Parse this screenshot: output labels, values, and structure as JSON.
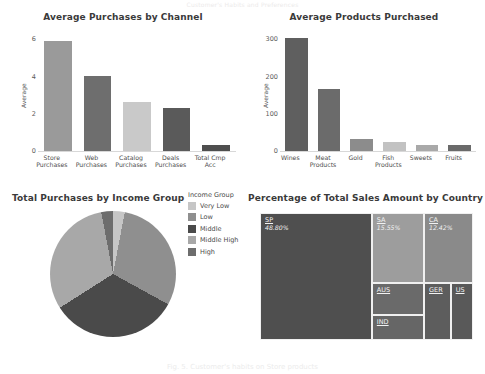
{
  "page": {
    "top_title": "Customer's Habits and Preferences",
    "caption": "Fig. 5.  Customer's habits on Store products"
  },
  "chart_data": [
    {
      "type": "bar",
      "title": "Average Purchases by Channel",
      "xlabel": "",
      "ylabel": "Average",
      "categories": [
        "Store Purchases",
        "Web Purchases",
        "Catalog Purchases",
        "Deals Purchases",
        "Total Cmp Acc"
      ],
      "values": [
        5.9,
        4.05,
        2.65,
        2.3,
        0.3
      ],
      "colors": [
        "#9a9a9a",
        "#6e6e6e",
        "#c9c9c9",
        "#5a5a5a",
        "#4e4e4e"
      ],
      "yticks": [
        0,
        2,
        4,
        6
      ],
      "ylim": [
        0,
        6.5
      ],
      "grid": false,
      "legend": "none"
    },
    {
      "type": "bar",
      "title": "Average Products Purchased",
      "xlabel": "",
      "ylabel": "Average",
      "categories": [
        "Wines",
        "Meat Products",
        "Gold",
        "Fish Products",
        "Sweets",
        "Fruits"
      ],
      "values": [
        303,
        167,
        33,
        25,
        15,
        17
      ],
      "colors": [
        "#5f5f5f",
        "#6b6b6b",
        "#8c8c8c",
        "#c2c2c2",
        "#a9a9a9",
        "#6a6a6a"
      ],
      "yticks": [
        0,
        100,
        200,
        300
      ],
      "ylim": [
        0,
        325
      ],
      "grid": false,
      "legend": "none"
    },
    {
      "type": "pie",
      "title": "Total Purchases by Income Group",
      "legend_title": "Income Group",
      "legend_position": "right",
      "slices": [
        {
          "label": "Very Low",
          "value": 3,
          "color": "#c6c6c6"
        },
        {
          "label": "Low",
          "value": 30,
          "color": "#8f8f8f"
        },
        {
          "label": "Middle",
          "value": 33,
          "color": "#4a4a4a"
        },
        {
          "label": "Middle High",
          "value": 31,
          "color": "#a8a8a8"
        },
        {
          "label": "High",
          "value": 3,
          "color": "#6d6d6d"
        }
      ]
    },
    {
      "type": "treemap",
      "title": "Percentage of Total Sales Amount by Country",
      "cells": [
        {
          "label": "SP",
          "value": "48.80%",
          "color": "#4f4f4f"
        },
        {
          "label": "SA",
          "value": "15.55%",
          "color": "#9d9d9d"
        },
        {
          "label": "CA",
          "value": "12.42%",
          "color": "#8a8a8a"
        },
        {
          "label": "AUS",
          "value": "",
          "color": "#6a6a6a"
        },
        {
          "label": "IND",
          "value": "",
          "color": "#666666"
        },
        {
          "label": "GER",
          "value": "",
          "color": "#5d5d5d"
        },
        {
          "label": "US",
          "value": "",
          "color": "#595959"
        }
      ]
    }
  ]
}
